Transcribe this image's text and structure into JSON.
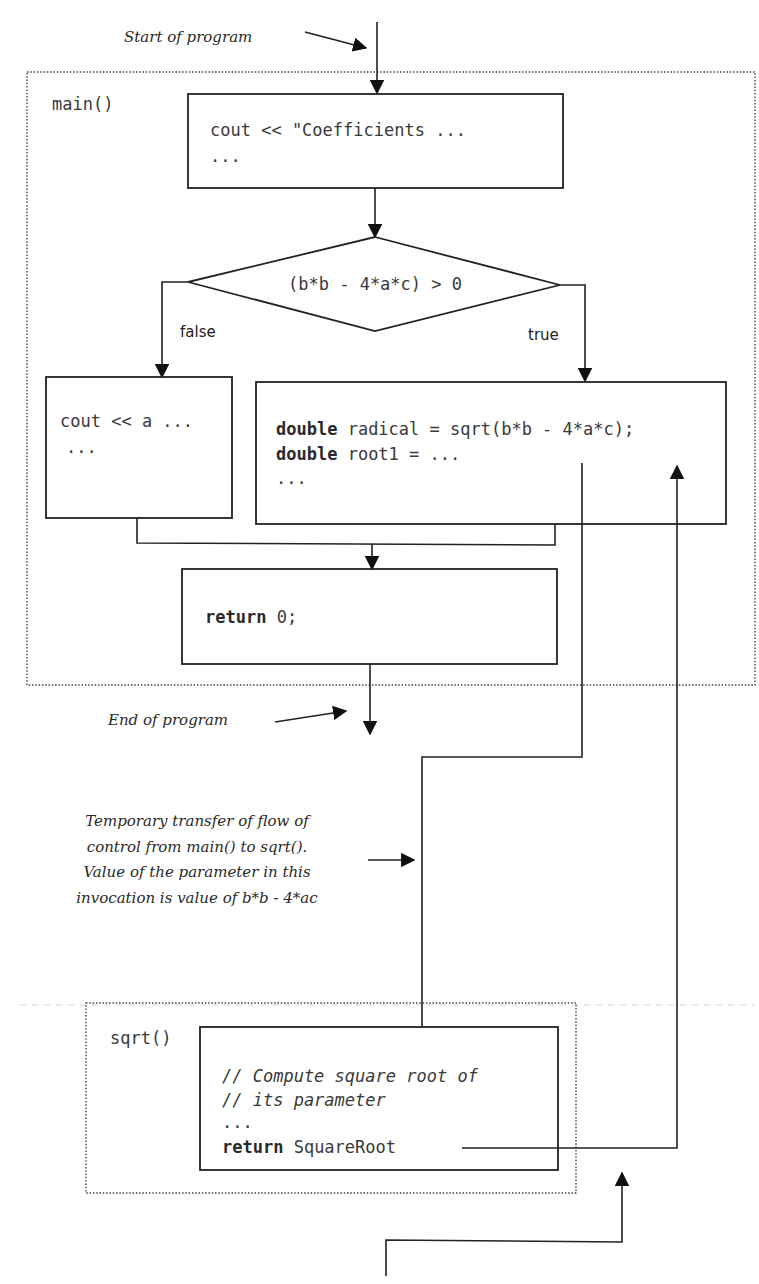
{
  "annotations": {
    "start": "Start of program",
    "end": "End of program",
    "transfer": [
      "Temporary transfer of flow of",
      "control  from main() to sqrt().",
      "Value of the parameter in this",
      "invocation is  value of b*b - 4*ac"
    ]
  },
  "main_function": {
    "label": "main()",
    "first_block": {
      "line1": "cout << \"Coefficients ...",
      "line2": "..."
    },
    "decision": {
      "condition": "(b*b - 4*a*c) > 0",
      "false_label": "false",
      "true_label": "true"
    },
    "false_block": {
      "line1": "cout << a ...",
      "line2": "..."
    },
    "true_block": {
      "line1_keyword": "double",
      "line1_rest": " radical = sqrt(b*b - 4*a*c);",
      "line2_keyword": "double",
      "line2_rest": " root1 = ...",
      "line3": "..."
    },
    "return_block": {
      "keyword": "return",
      "rest": " 0;"
    }
  },
  "sqrt_function": {
    "label": "sqrt()",
    "body": {
      "comment1": "// Compute square root of",
      "comment2": "// its parameter",
      "ellipsis": "...",
      "return_keyword": "return",
      "return_rest": " SquareRoot"
    }
  }
}
